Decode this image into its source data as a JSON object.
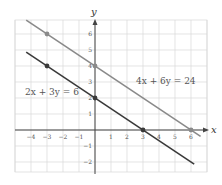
{
  "chart_data": {
    "type": "line",
    "title": "",
    "xlabel": "x",
    "ylabel": "y",
    "xlim": [
      -5,
      7
    ],
    "ylim": [
      -3,
      7
    ],
    "grid": true,
    "x_ticks": [
      -4,
      -3,
      -2,
      -1,
      1,
      2,
      3,
      4,
      5,
      6
    ],
    "y_ticks": [
      -2,
      -1,
      1,
      2,
      3,
      4,
      5,
      6
    ],
    "series": [
      {
        "name": "4x + 6y = 24",
        "color": "#8a8a8a",
        "x_range": [
          -4.3,
          6.6
        ],
        "points": [
          {
            "x": -3,
            "y": 6
          },
          {
            "x": 0,
            "y": 4
          },
          {
            "x": 6,
            "y": 0
          }
        ]
      },
      {
        "name": "2x + 3y = 6",
        "color": "#3a3a3a",
        "x_range": [
          -4.3,
          6.2
        ],
        "points": [
          {
            "x": -3,
            "y": 4
          },
          {
            "x": 0,
            "y": 2
          },
          {
            "x": 3,
            "y": 0
          }
        ]
      }
    ],
    "annotations": [
      {
        "text": "4x + 6y = 24",
        "x": 3.5,
        "y": 1.7
      },
      {
        "text": "2x + 3y = 6",
        "x": -2.5,
        "y": 2.2
      }
    ]
  },
  "labels": {
    "x_axis": "x",
    "y_axis": "y",
    "eq1": "4x + 6y = 24",
    "eq2": "2x + 3y = 6"
  }
}
